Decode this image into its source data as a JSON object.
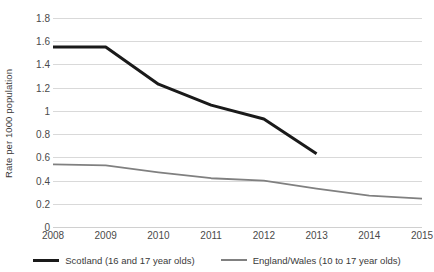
{
  "chart_data": {
    "type": "line",
    "title": "",
    "xlabel": "",
    "ylabel": "Rate per 1000 population",
    "categories": [
      "2008",
      "2009",
      "2010",
      "2011",
      "2012",
      "2013",
      "2014",
      "2015"
    ],
    "ylim": [
      0,
      1.8
    ],
    "ytick_labels": [
      "0",
      "0.2",
      "0.4",
      "0.6",
      "0.8",
      "1",
      "1.2",
      "1.4",
      "1.6",
      "1.8"
    ],
    "ytick_values": [
      0,
      0.2,
      0.4,
      0.6,
      0.8,
      1.0,
      1.2,
      1.4,
      1.6,
      1.8
    ],
    "grid": true,
    "legend_position": "bottom",
    "series": [
      {
        "name": "Scotland (16 and 17 year olds)",
        "color": "#1a1a1a",
        "width": 3,
        "x": [
          "2008",
          "2009",
          "2010",
          "2011",
          "2012",
          "2013"
        ],
        "values": [
          1.55,
          1.55,
          1.23,
          1.05,
          0.93,
          0.63
        ]
      },
      {
        "name": "England/Wales (10 to 17 year olds)",
        "color": "#808080",
        "width": 1.8,
        "x": [
          "2008",
          "2009",
          "2010",
          "2011",
          "2012",
          "2013",
          "2014",
          "2015"
        ],
        "values": [
          0.54,
          0.53,
          0.47,
          0.42,
          0.4,
          0.33,
          0.27,
          0.245
        ]
      }
    ]
  },
  "legend": {
    "items": [
      {
        "label": "Scotland (16 and 17 year olds)"
      },
      {
        "label": "England/Wales (10 to 17 year olds)"
      }
    ]
  }
}
